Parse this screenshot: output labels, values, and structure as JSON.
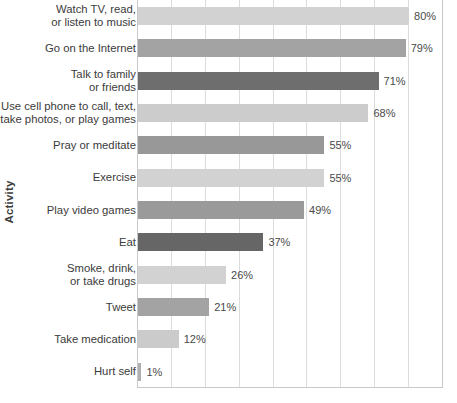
{
  "chart_data": {
    "type": "bar",
    "orientation": "horizontal",
    "title": "",
    "xlabel": "",
    "ylabel": "Activity",
    "xlim": [
      0,
      90
    ],
    "ylim": null,
    "grid": true,
    "gridlines_x": [
      0,
      10,
      20,
      30,
      40,
      50,
      60,
      70,
      80,
      90
    ],
    "legend": null,
    "x_tick_labels": [],
    "value_suffix": "%",
    "categories": [
      "Watch TV, read,\nor listen to music",
      "Go on the Internet",
      "Talk to family\nor friends",
      "Use cell phone to call, text,\ntake photos, or play games",
      "Pray or meditate",
      "Exercise",
      "Play video games",
      "Eat",
      "Smoke, drink,\nor take drugs",
      "Tweet",
      "Take medication",
      "Hurt self"
    ],
    "values": [
      80,
      79,
      71,
      68,
      55,
      55,
      49,
      37,
      26,
      21,
      12,
      1
    ],
    "value_labels": [
      "80%",
      "79%",
      "71%",
      "68%",
      "55%",
      "55%",
      "49%",
      "37%",
      "26%",
      "21%",
      "12%",
      "1%"
    ],
    "bar_colors": [
      "#d2d2d2",
      "#a3a3a3",
      "#6e6e6e",
      "#cccccc",
      "#989898",
      "#d2d2d2",
      "#9a9a9a",
      "#666666",
      "#d2d2d2",
      "#a3a3a3",
      "#cbcbcb",
      "#b0b0b0"
    ]
  },
  "colors": {
    "background": "#ffffff",
    "axis": "#c9c9c9",
    "gridline": "#dcdcdc",
    "text": "#3b3b3b",
    "value_text": "#4a4a4a",
    "bar_light": "#d2d2d2",
    "bar_medium": "#a3a3a3",
    "bar_dark": "#6e6e6e"
  }
}
